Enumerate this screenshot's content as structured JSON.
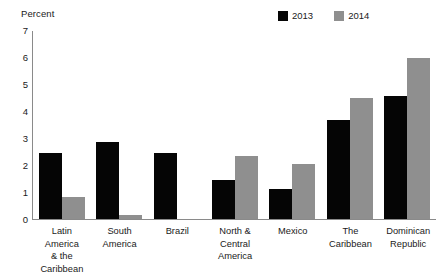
{
  "chart_data": {
    "type": "bar",
    "title": "",
    "xlabel": "",
    "ylabel": "Percent",
    "ylim": [
      0,
      7
    ],
    "ytick_labels": [
      "7",
      "6",
      "5",
      "4",
      "3",
      "2",
      "1",
      "0"
    ],
    "yticks": [
      7,
      6,
      5,
      4,
      3,
      2,
      1,
      0
    ],
    "grid": false,
    "legend_position": "top-right",
    "categories": [
      "Latin America\n& the\nCaribbean",
      "South\nAmerica",
      "Brazil",
      "North &\nCentral\nAmerica",
      "Mexico",
      "The\nCaribbean",
      "Dominican\nRepublic"
    ],
    "series": [
      {
        "name": "2013",
        "color": "#050505",
        "values": [
          2.45,
          2.85,
          2.45,
          1.45,
          1.1,
          3.65,
          4.55
        ]
      },
      {
        "name": "2014",
        "color": "#8f8f8f",
        "values": [
          0.8,
          0.15,
          0.0,
          2.35,
          2.05,
          4.5,
          5.95
        ]
      }
    ]
  },
  "axis": {
    "y_title": "Percent"
  },
  "legend": {
    "entries": [
      {
        "label": "2013",
        "color": "#050505"
      },
      {
        "label": "2014",
        "color": "#8f8f8f"
      }
    ]
  }
}
